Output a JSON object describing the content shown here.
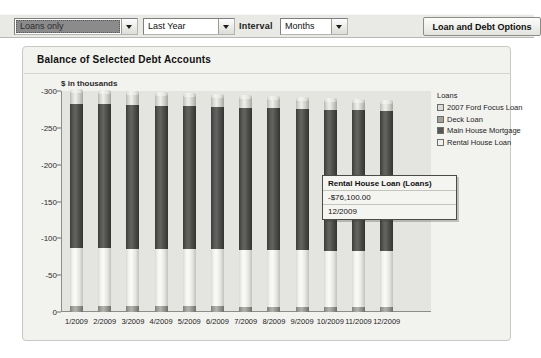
{
  "toolbar": {
    "account_filter": {
      "value": "Loans only",
      "icon": "chevron-down-icon"
    },
    "period_filter": {
      "value": "Last Year",
      "icon": "chevron-down-icon"
    },
    "interval_label": "Interval",
    "interval_filter": {
      "value": "Months",
      "icon": "chevron-down-icon"
    },
    "options_button": "Loan and Debt Options"
  },
  "panel": {
    "title": "Balance of Selected Debt Accounts",
    "unit_label": "$ in thousands"
  },
  "legend": {
    "title": "Loans",
    "items": [
      {
        "label": "2007 Ford Focus Loan",
        "color": "#dcdcd8"
      },
      {
        "label": "Deck Loan",
        "color": "#a1a19d"
      },
      {
        "label": "Main House Mortgage",
        "color": "#575755"
      },
      {
        "label": "Rental House Loan",
        "color": "#f0f0ec"
      }
    ]
  },
  "tooltip": {
    "title": "Rental House Loan (Loans)",
    "value": "-$76,100.00",
    "date": "12/2009"
  },
  "chart_data": {
    "type": "bar",
    "subtype": "stacked-column",
    "title": "Balance of Selected Debt Accounts",
    "subtitle": "$ in thousands",
    "xlabel": "",
    "ylabel": "$ in thousands",
    "ylim": [
      -300,
      0
    ],
    "yticks": [
      -300,
      -250,
      -200,
      -150,
      -100,
      -50,
      0
    ],
    "ytick_labels": [
      "-300",
      "-250",
      "-200",
      "-150",
      "-100",
      "-50",
      "0"
    ],
    "grid": false,
    "legend_position": "right",
    "categories": [
      "1/2009",
      "2/2009",
      "3/2009",
      "4/2009",
      "5/2009",
      "6/2009",
      "7/2009",
      "8/2009",
      "9/2009",
      "10/2009",
      "11/2009",
      "12/2009"
    ],
    "series": [
      {
        "name": "Rental House Loan",
        "color": "#f0f0ec",
        "values": [
          -78.5,
          -78.3,
          -78.1,
          -77.9,
          -77.7,
          -77.5,
          -77.3,
          -77.0,
          -76.8,
          -76.6,
          -76.4,
          -76.1
        ]
      },
      {
        "name": "Main House Mortgage",
        "color": "#575755",
        "values": [
          -196,
          -195.5,
          -195,
          -194.5,
          -194,
          -193.5,
          -193,
          -192.5,
          -192,
          -191.5,
          -191,
          -190.5
        ]
      },
      {
        "name": "Deck Loan",
        "color": "#a1a19d",
        "values": [
          -8.5,
          -8.3,
          -8.1,
          -7.9,
          -7.7,
          -7.5,
          -7.3,
          -7.1,
          -6.9,
          -6.7,
          -6.5,
          -6.3
        ]
      },
      {
        "name": "2007 Ford Focus Loan",
        "color": "#dcdcd8",
        "values": [
          -17,
          -16.6,
          -16.2,
          -15.8,
          -15.4,
          -15.0,
          -14.6,
          -14.2,
          -13.8,
          -13.4,
          -13.0,
          -12.6
        ]
      }
    ],
    "totals": [
      -300,
      -298.7,
      -297.4,
      -296.1,
      -294.8,
      -293.5,
      -292.2,
      -290.8,
      -289.5,
      -288.2,
      -286.9,
      -285.5
    ],
    "annotation": {
      "series": "Rental House Loan",
      "category": "12/2009",
      "value": "-$76,100.00"
    }
  }
}
